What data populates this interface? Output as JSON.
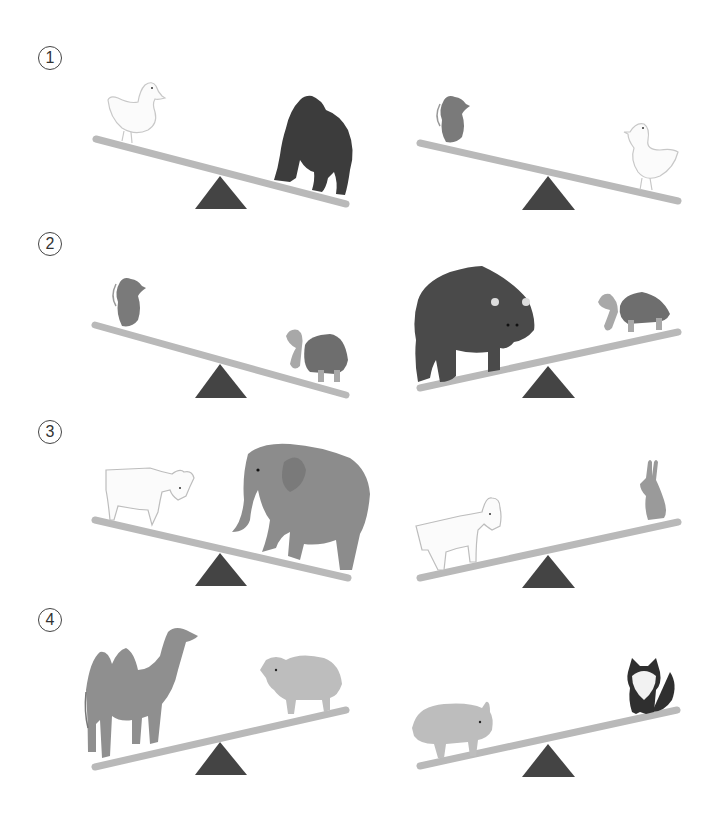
{
  "worksheet": {
    "questions": [
      {
        "number": "1",
        "left_seesaw": {
          "left_animal": "duck",
          "right_animal": "gorilla",
          "heavier_side": "right"
        },
        "right_seesaw": {
          "left_animal": "rat",
          "right_animal": "duck",
          "heavier_side": "right"
        }
      },
      {
        "number": "2",
        "left_seesaw": {
          "left_animal": "rat",
          "right_animal": "tortoise",
          "heavier_side": "right"
        },
        "right_seesaw": {
          "left_animal": "bear",
          "right_animal": "tortoise",
          "heavier_side": "left"
        }
      },
      {
        "number": "3",
        "left_seesaw": {
          "left_animal": "goat",
          "right_animal": "elephant",
          "heavier_side": "right"
        },
        "right_seesaw": {
          "left_animal": "goat",
          "right_animal": "rabbit",
          "heavier_side": "left"
        }
      },
      {
        "number": "4",
        "left_seesaw": {
          "left_animal": "camel",
          "right_animal": "pig",
          "heavier_side": "left"
        },
        "right_seesaw": {
          "left_animal": "pig",
          "right_animal": "cat",
          "heavier_side": "left"
        }
      }
    ],
    "colors": {
      "plank": "#b9b9b9",
      "fulcrum": "#444444",
      "light_animal": "#f4f4f4",
      "mid_animal": "#8a8a8a",
      "dark_animal": "#3f3f3f"
    }
  }
}
